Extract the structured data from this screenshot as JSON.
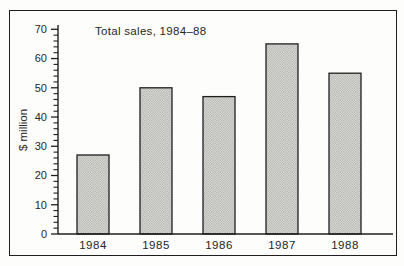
{
  "figure": {
    "title": "Total sales, 1984–88",
    "ylabel": "$ million"
  },
  "chart_data": {
    "type": "bar",
    "title": "Total sales, 1984–88",
    "xlabel": "",
    "ylabel": "$ million",
    "categories": [
      "1984",
      "1985",
      "1986",
      "1987",
      "1988"
    ],
    "values": [
      27,
      50,
      47,
      65,
      55
    ],
    "ylim": [
      0,
      70
    ],
    "ytick_major_interval": 10,
    "ytick_minor_interval": 2,
    "ytick_labels": [
      "0",
      "10",
      "20",
      "30",
      "40",
      "50",
      "60",
      "70"
    ],
    "grid": false,
    "legend": "none",
    "bar_fill_style": "halftone-dot-screen",
    "colors": {
      "ink": "#262626",
      "axis": "#1f1f1f",
      "paper": "#fdfdfc",
      "bar_dot_light": "#e7e7e4",
      "bar_dot_dark": "#a9a9a6",
      "bar_outline": "#1f1f1f"
    }
  }
}
